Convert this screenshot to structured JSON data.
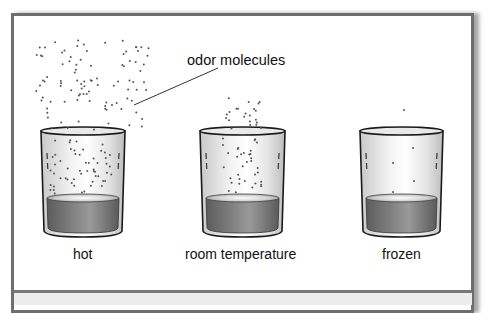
{
  "annotation": {
    "label": "odor molecules"
  },
  "glasses": [
    {
      "id": "hot",
      "label": "hot",
      "molecule_density": "high",
      "vapor_spread": "wide cloud above glass"
    },
    {
      "id": "room",
      "label": "room temperature",
      "molecule_density": "medium",
      "vapor_spread": "narrow column above glass"
    },
    {
      "id": "frozen",
      "label": "frozen",
      "molecule_density": "low",
      "vapor_spread": "single molecule above glass"
    }
  ],
  "colors": {
    "frame": "#6e6e6e",
    "liquid": "#7a7a7a",
    "glass_outline": "#1a1a1a",
    "molecule": "#555555",
    "background": "#ffffff",
    "bottom_strip": "#ececec"
  }
}
